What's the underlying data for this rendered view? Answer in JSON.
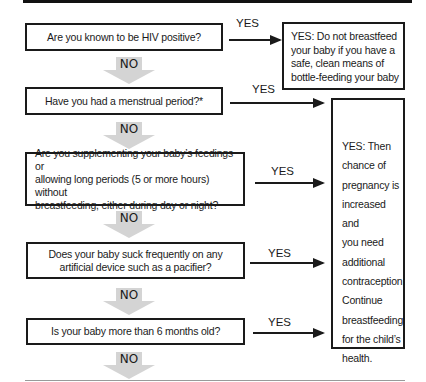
{
  "flowchart": {
    "questions": [
      {
        "id": "q1",
        "text": "Are you known to be HIV positive?"
      },
      {
        "id": "q2",
        "text": "Have you had a menstrual period?*"
      },
      {
        "id": "q3",
        "lines": [
          "Are you supplementing your baby’s feedings or",
          "allowing long periods (5 or more hours) without",
          "breastfeeding, either during day or night?"
        ]
      },
      {
        "id": "q4",
        "lines": [
          "Does your baby suck frequently on any",
          "artificial device such as a pacifier?"
        ]
      },
      {
        "id": "q5",
        "text": "Is your baby more than 6 months old?"
      }
    ],
    "yes_label": "YES",
    "no_label": "NO",
    "outcomes": {
      "hiv": {
        "lines": [
          "YES: Do not breastfeed",
          "your baby if you have a",
          "safe, clean means of",
          "bottle-feeding your baby"
        ]
      },
      "pregnancy_risk": {
        "lines": [
          "YES: Then",
          "chance of",
          "pregnancy is",
          "increased and",
          "you need",
          "additional",
          "contraception.",
          "Continue",
          "breastfeeding",
          "for the child’s",
          "health."
        ]
      }
    },
    "colors": {
      "border": "#1a1a1a",
      "no_arrow_fill": "#d4d4d4",
      "top_bar": "#111111",
      "bottom_rule": "#9a9a9a"
    }
  }
}
